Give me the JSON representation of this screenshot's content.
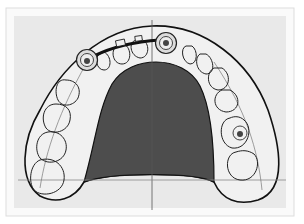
{
  "diagram": {
    "elements": {
      "implants": [
        {
          "id": "implant-upper-left",
          "cx": 87,
          "cy": 60
        },
        {
          "id": "implant-upper-right",
          "cx": 166,
          "cy": 43
        },
        {
          "id": "implant-lower-right",
          "cx": 239,
          "cy": 133
        }
      ],
      "bar": {
        "id": "connecting-bar"
      },
      "midline": {
        "x": 152
      },
      "baseline": {
        "y": 180
      }
    },
    "colors": {
      "background": "#e9e9e9",
      "outer_border": "#f8f8f8",
      "palate": "#4d4d4d",
      "outline": "#111111",
      "tooth_fill": "#f1f1f1",
      "guide_line": "#777777"
    }
  }
}
